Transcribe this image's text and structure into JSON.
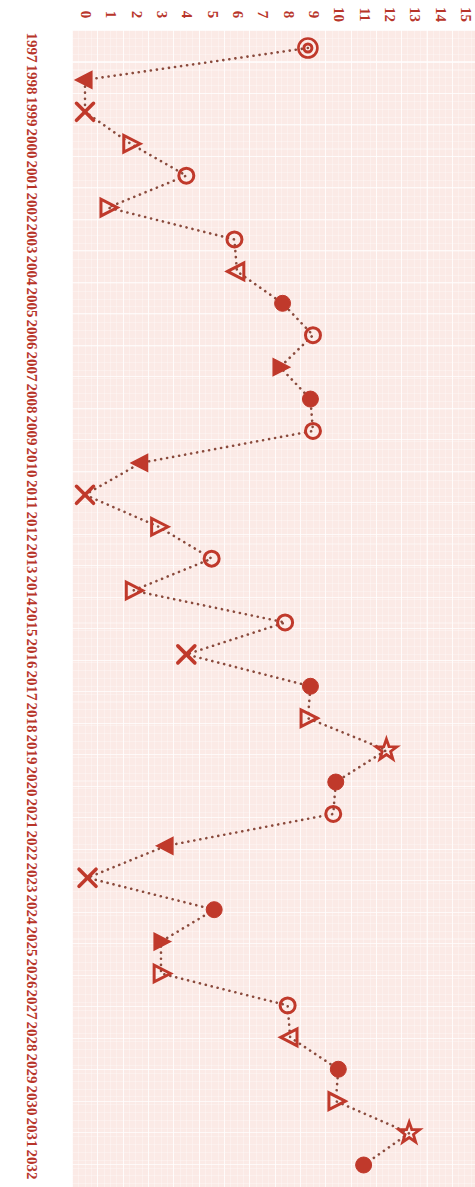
{
  "chart_data": {
    "type": "scatter",
    "orientation": "rotated-90",
    "title": "",
    "xlabel": "",
    "ylabel": "",
    "xlim": [
      0,
      15
    ],
    "xticks": [
      "0",
      "1",
      "2",
      "3",
      "4",
      "5",
      "6",
      "7",
      "8",
      "9",
      "10",
      "11",
      "12",
      "13",
      "14",
      "15"
    ],
    "grid": true,
    "legend": "none",
    "accent_color": "#c0392b",
    "background_color": "#fbeae6",
    "gridline_color": "#ffffff",
    "categories": [
      "1997",
      "1998",
      "1999",
      "2000",
      "2001",
      "2002",
      "2003",
      "2004",
      "2005",
      "2006",
      "2007",
      "2008",
      "2009",
      "2010",
      "2011",
      "2012",
      "2013",
      "2014",
      "2015",
      "2016",
      "2017",
      "2018",
      "2019",
      "2020",
      "2021",
      "2022",
      "2023",
      "2024",
      "2025",
      "2026",
      "2027",
      "2028",
      "2029",
      "2030",
      "2031",
      "2032"
    ],
    "values": [
      8.8,
      0.0,
      0.0,
      1.8,
      4.0,
      0.9,
      5.9,
      6.0,
      7.8,
      9.0,
      7.7,
      8.9,
      9.0,
      2.2,
      0.0,
      2.9,
      5.0,
      1.9,
      7.9,
      4.0,
      8.9,
      8.8,
      11.9,
      9.9,
      9.8,
      3.2,
      0.1,
      5.1,
      3.0,
      3.0,
      8.0,
      8.1,
      10.0,
      9.9,
      12.8,
      11.0
    ],
    "markers": [
      "circle-dot",
      "triangle-left-filled",
      "x-mark",
      "triangle-right-open",
      "circle-open",
      "triangle-right-open",
      "circle-open",
      "triangle-left-open",
      "circle-filled",
      "circle-open",
      "triangle-right-filled",
      "circle-filled",
      "circle-open",
      "triangle-left-filled",
      "x-mark",
      "triangle-right-open",
      "circle-open",
      "triangle-right-open",
      "circle-open",
      "x-mark",
      "circle-filled",
      "triangle-right-open",
      "star-open",
      "circle-filled",
      "circle-open",
      "triangle-left-filled",
      "x-mark",
      "circle-filled",
      "triangle-right-filled",
      "triangle-right-open",
      "circle-open",
      "triangle-left-open",
      "circle-filled",
      "triangle-right-open",
      "star-open",
      "circle-filled"
    ]
  }
}
